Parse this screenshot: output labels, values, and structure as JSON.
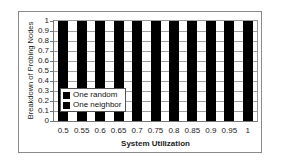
{
  "chart_data": {
    "type": "bar",
    "stacked": true,
    "title": "",
    "xlabel": "System Utilization",
    "ylabel": "Breakdown of Probing Nodes",
    "categories": [
      "0.5",
      "0.55",
      "0.6",
      "0.65",
      "0.7",
      "0.75",
      "0.8",
      "0.85",
      "0.9",
      "0.95",
      "1"
    ],
    "series": [
      {
        "name": "One random",
        "color": "#000000",
        "values": [
          0,
          0,
          0,
          0,
          0,
          0,
          0,
          0,
          0,
          0,
          0
        ]
      },
      {
        "name": "One neighbor",
        "color": "#000000",
        "values": [
          1,
          1,
          1,
          1,
          1,
          1,
          1,
          1,
          1,
          1,
          1
        ]
      }
    ],
    "ylim": [
      0,
      1
    ],
    "yticks": [
      "0",
      "0.1",
      "0.2",
      "0.3",
      "0.4",
      "0.5",
      "0.6",
      "0.7",
      "0.8",
      "0.9",
      "1"
    ],
    "grid": true,
    "legend_position": "lower-left inside plot"
  },
  "legend": {
    "items": [
      {
        "label": "One random",
        "color": "#000000"
      },
      {
        "label": "One neighbor",
        "color": "#000000"
      }
    ]
  },
  "axes": {
    "xlabel": "System Utilization",
    "ylabel": "Breakdown of Probing Nodes"
  }
}
